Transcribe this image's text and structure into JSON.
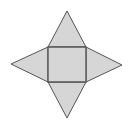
{
  "diagram": {
    "type": "square-pyramid-net",
    "colors": {
      "fill": "#d6d6d6",
      "stroke": "#555555",
      "background": "#ffffff"
    },
    "square": {
      "x1": 48,
      "y1": 47,
      "x2": 86,
      "y2": 82
    },
    "apexes": {
      "top": [
        67,
        11
      ],
      "bottom": [
        67,
        118
      ],
      "left": [
        11,
        64
      ],
      "right": [
        122,
        65
      ]
    }
  }
}
